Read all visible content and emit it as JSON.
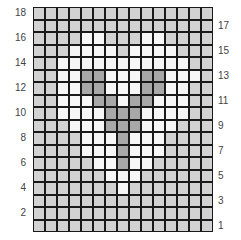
{
  "colors": {
    "G": "#d2d2d2",
    "W": "#f6f6f6",
    "D": "#a8a8a8",
    "line": "#1a1a1a"
  },
  "rows_top_to_bottom": [
    "GGGGGGGGGGGGGGG",
    "GGGGGGGGGGGGGGG",
    "GGGGWWGGGWWGGGG",
    "GGGWWWWGWWWWGGG",
    "GGWWWWWWWWWWWGG",
    "GGWWDDWWWDDWWWG",
    "GGWWDDWWWDDWWGG",
    "GGWWWDDWDDWWWGG",
    "GGWWWWDDDWWWWGG",
    "GGGWWWDDDWWWGGG",
    "GGGGWWWDWWWGGGG",
    "GGGGWWWDWWWGGGG",
    "GGGGGWWDWWGGGGG",
    "GGGGGGWWWGGGGGG",
    "GGGGGGGWGGGGGGG",
    "GGGGGGGGGGGGGGG",
    "GGGGGGGGGGGGGGG",
    "GGGGGGGGGGGGGGG"
  ],
  "left_labels": [
    {
      "text": "18",
      "row": 18
    },
    {
      "text": "16",
      "row": 16
    },
    {
      "text": "14",
      "row": 14
    },
    {
      "text": "12",
      "row": 12
    },
    {
      "text": "10",
      "row": 10
    },
    {
      "text": "8",
      "row": 8
    },
    {
      "text": "6",
      "row": 6
    },
    {
      "text": "4",
      "row": 4
    },
    {
      "text": "2",
      "row": 2
    }
  ],
  "right_labels": [
    {
      "text": "17",
      "row": 17
    },
    {
      "text": "15",
      "row": 15
    },
    {
      "text": "13",
      "row": 13
    },
    {
      "text": "11",
      "row": 11
    },
    {
      "text": "9",
      "row": 9
    },
    {
      "text": "7",
      "row": 7
    },
    {
      "text": "5",
      "row": 5
    },
    {
      "text": "3",
      "row": 3
    },
    {
      "text": "1",
      "row": 1
    }
  ]
}
